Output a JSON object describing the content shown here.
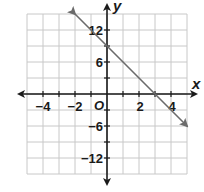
{
  "chart_data": {
    "type": "line",
    "title": "",
    "xlabel": "x",
    "ylabel": "y",
    "origin_label": "O",
    "xlim": [
      -5,
      5
    ],
    "ylim": [
      -15,
      15
    ],
    "grid": true,
    "x_grid_step": 1,
    "y_grid_step": 3,
    "x_tick_labels": [
      "−4",
      "−2",
      "2",
      "4"
    ],
    "x_tick_values": [
      -4,
      -2,
      2,
      4
    ],
    "y_tick_labels": [
      "12",
      "6",
      "−6",
      "−12"
    ],
    "y_tick_values": [
      12,
      6,
      -6,
      -12
    ],
    "series": [
      {
        "name": "line",
        "equation": "y = -3x + 9",
        "x": [
          -2,
          5
        ],
        "y": [
          15,
          -6
        ],
        "arrows": "both",
        "color": "#6b6b6b"
      }
    ],
    "colors": {
      "grid": "#c8c8c8",
      "axis": "#1a1a1a",
      "line": "#6b6b6b"
    }
  }
}
